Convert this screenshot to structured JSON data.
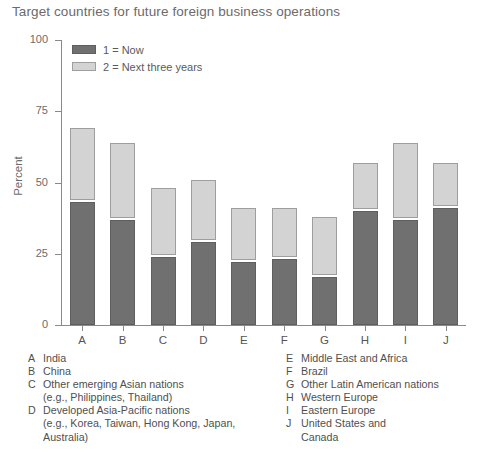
{
  "title": "Target countries for future foreign business operations",
  "axis": {
    "ylabel": "Percent",
    "yticks": [
      "0",
      "25",
      "50",
      "75",
      "100"
    ],
    "xticks": [
      "A",
      "B",
      "C",
      "D",
      "E",
      "F",
      "G",
      "H",
      "I",
      "J"
    ]
  },
  "legend": {
    "items": [
      {
        "label": "1 = Now",
        "color": "#707070",
        "swatch": "now"
      },
      {
        "label": "2 = Next three years",
        "color": "#d3d3d3",
        "swatch": "next"
      }
    ]
  },
  "key": {
    "left": [
      {
        "letter": "A",
        "desc": "India",
        "sub": ""
      },
      {
        "letter": "B",
        "desc": "China",
        "sub": ""
      },
      {
        "letter": "C",
        "desc": "Other emerging Asian nations",
        "sub": "(e.g., Philippines, Thailand)"
      },
      {
        "letter": "D",
        "desc": "Developed Asia-Pacific nations",
        "sub": "(e.g., Korea, Taiwan, Hong Kong, Japan, Australia)"
      }
    ],
    "right": [
      {
        "letter": "E",
        "desc": "Middle East and Africa",
        "sub": ""
      },
      {
        "letter": "F",
        "desc": "Brazil",
        "sub": ""
      },
      {
        "letter": "G",
        "desc": "Other Latin American nations",
        "sub": ""
      },
      {
        "letter": "H",
        "desc": "Western Europe",
        "sub": ""
      },
      {
        "letter": "I",
        "desc": "Eastern Europe",
        "sub": ""
      },
      {
        "letter": "J",
        "desc": "United States and",
        "sub": "Canada"
      }
    ]
  },
  "chart_data": {
    "type": "bar",
    "stacked": true,
    "title": "Target countries for future foreign business operations",
    "xlabel": "",
    "ylabel": "Percent",
    "ylim": [
      0,
      100
    ],
    "yticks": [
      0,
      25,
      50,
      75,
      100
    ],
    "grid": false,
    "legend_position": "top-left",
    "categories": [
      "A",
      "B",
      "C",
      "D",
      "E",
      "F",
      "G",
      "H",
      "I",
      "J"
    ],
    "category_names": [
      "India",
      "China",
      "Other emerging Asian nations (e.g., Philippines, Thailand)",
      "Developed Asia-Pacific nations (e.g., Korea, Taiwan, Hong Kong, Japan, Australia)",
      "Middle East and Africa",
      "Brazil",
      "Other Latin American nations",
      "Western Europe",
      "Eastern Europe",
      "United States and Canada"
    ],
    "series": [
      {
        "name": "1 = Now",
        "color": "#707070",
        "values": [
          43,
          37,
          24,
          29,
          22,
          23,
          17,
          40,
          37,
          41
        ]
      },
      {
        "name": "2 = Next three years",
        "color": "#d3d3d3",
        "values": [
          26,
          27,
          24,
          22,
          19,
          18,
          21,
          17,
          27,
          16
        ]
      }
    ],
    "totals": [
      69,
      64,
      48,
      51,
      41,
      41,
      38,
      57,
      64,
      57
    ]
  }
}
